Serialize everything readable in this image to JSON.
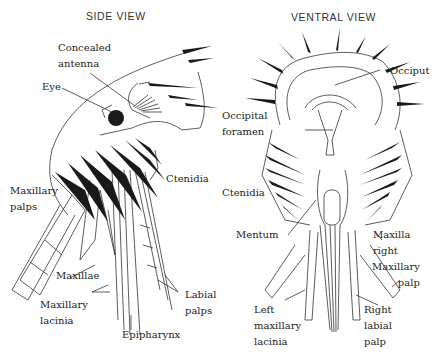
{
  "figure": {
    "panels": [
      {
        "title": "SIDE VIEW",
        "labels": [
          {
            "id": "concealed-antenna",
            "lines": [
              "Concealed",
              "antenna"
            ]
          },
          {
            "id": "eye",
            "lines": [
              "Eye"
            ]
          },
          {
            "id": "ctenidia",
            "lines": [
              "Ctenidia"
            ]
          },
          {
            "id": "maxillary-palps",
            "lines": [
              "Maxillary",
              "palps"
            ]
          },
          {
            "id": "maxillae",
            "lines": [
              "Maxillae"
            ]
          },
          {
            "id": "maxillary-lacinia",
            "lines": [
              "Maxillary",
              "lacinia"
            ]
          },
          {
            "id": "epipharynx",
            "lines": [
              "Epipharynx"
            ]
          },
          {
            "id": "labial-palps",
            "lines": [
              "Labial",
              "palps"
            ]
          }
        ]
      },
      {
        "title": "VENTRAL VIEW",
        "labels": [
          {
            "id": "occiput",
            "lines": [
              "Occiput"
            ]
          },
          {
            "id": "occipital-foramen",
            "lines": [
              "Occipital",
              "foramen"
            ]
          },
          {
            "id": "ctenidia",
            "lines": [
              "Ctenidia"
            ]
          },
          {
            "id": "mentum",
            "lines": [
              "Mentum"
            ]
          },
          {
            "id": "maxilla-right",
            "lines": [
              "Maxilla",
              "right"
            ]
          },
          {
            "id": "maxillary-palp",
            "lines": [
              "Maxillary",
              "palp"
            ]
          },
          {
            "id": "left-maxillary-lacinia",
            "lines": [
              "Left",
              "maxillary",
              "lacinia"
            ]
          },
          {
            "id": "right-labial-palp",
            "lines": [
              "Right",
              "labial",
              "palp"
            ]
          }
        ]
      }
    ]
  },
  "colors": {
    "ink": "#1a1a1a",
    "line": "#333333",
    "background": "#ffffff"
  }
}
